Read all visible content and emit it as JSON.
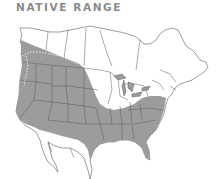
{
  "title": "NATIVE RANGE",
  "map": {
    "region": "North America",
    "legend": "shaded area indicates native range",
    "colors": {
      "range_fill": "#9c9c9c",
      "land_fill": "#ffffff",
      "borders": "#5a5a5a",
      "title": "#8a8a8a"
    }
  }
}
